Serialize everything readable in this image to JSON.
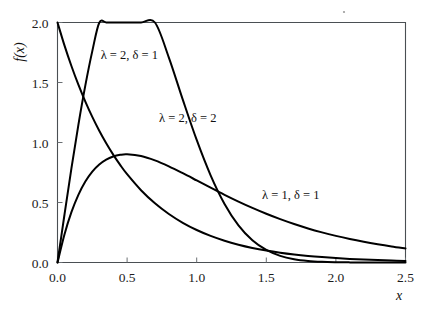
{
  "chart_data": {
    "type": "line",
    "title": "",
    "subtitle": "",
    "xlabel": "x",
    "ylabel": "f(x)",
    "xlim": [
      0.0,
      2.5
    ],
    "ylim": [
      0.0,
      2.0
    ],
    "xticks": [
      "0.0",
      "0.5",
      "1.0",
      "1.5",
      "2.0",
      "2.5"
    ],
    "xtick_values": [
      0.0,
      0.5,
      1.0,
      1.5,
      2.0,
      2.5
    ],
    "yticks": [
      "0.0",
      "0.5",
      "1.0",
      "1.5",
      "2.0"
    ],
    "ytick_values": [
      0.0,
      0.5,
      1.0,
      1.5,
      2.0
    ],
    "grid": false,
    "legend_position": "inline-annotations",
    "series": [
      {
        "name": "λ = 2, δ = 1",
        "lambda": 2,
        "delta": 1,
        "label_x": 0.31,
        "label_y": 1.7,
        "x": [
          0.0,
          0.05,
          0.1,
          0.15,
          0.2,
          0.25,
          0.3,
          0.35,
          0.4,
          0.45,
          0.5,
          0.6,
          0.7,
          0.8,
          0.9,
          1.0,
          1.1,
          1.2,
          1.3,
          1.4,
          1.5,
          1.6,
          1.7,
          1.8,
          1.9,
          2.0,
          2.1,
          2.2,
          2.3,
          2.4,
          2.5
        ],
        "values": [
          2.0,
          1.8097,
          1.6375,
          1.4816,
          1.3406,
          1.2131,
          1.0976,
          0.9932,
          0.8987,
          0.8131,
          0.7358,
          0.6024,
          0.4932,
          0.4038,
          0.3306,
          0.2707,
          0.2216,
          0.1815,
          0.1486,
          0.1216,
          0.0996,
          0.0815,
          0.0668,
          0.0547,
          0.0448,
          0.0366,
          0.03,
          0.0246,
          0.0201,
          0.0165,
          0.0135
        ]
      },
      {
        "name": "λ = 2, δ = 2",
        "lambda": 2,
        "delta": 2,
        "label_x": 0.73,
        "label_y": 1.17,
        "x": [
          0.0,
          0.05,
          0.1,
          0.15,
          0.2,
          0.25,
          0.3,
          0.35,
          0.4,
          0.45,
          0.5,
          0.6,
          0.7,
          0.8,
          0.9,
          1.0,
          1.1,
          1.2,
          1.3,
          1.4,
          1.5,
          1.6,
          1.7,
          1.8,
          1.9,
          2.0,
          2.1,
          2.2,
          2.3,
          2.4,
          2.5
        ],
        "values": [
          0.0,
          0.398,
          0.7842,
          1.1468,
          1.4756,
          1.7616,
          1.9983,
          2.181,
          2.3076,
          2.3785,
          2.3963,
          2.282,
          2.0334,
          1.7079,
          1.3574,
          1.0212,
          0.7264,
          0.488,
          0.3093,
          0.185,
          0.1044,
          0.0556,
          0.0279,
          0.0132,
          0.0059,
          0.0025,
          0.001,
          0.0004,
          0.0001,
          0.0,
          0.0
        ]
      },
      {
        "name": "λ = 1, δ = 1",
        "lambda": 1,
        "delta": 1,
        "label_x": 1.47,
        "label_y": 0.53,
        "x": [
          0.0,
          0.05,
          0.1,
          0.15,
          0.2,
          0.25,
          0.3,
          0.35,
          0.4,
          0.45,
          0.5,
          0.6,
          0.7,
          0.8,
          0.9,
          1.0,
          1.1,
          1.2,
          1.3,
          1.4,
          1.5,
          1.6,
          1.7,
          1.8,
          1.9,
          2.0,
          2.1,
          2.2,
          2.3,
          2.4,
          2.5
        ],
        "values": [
          0.0,
          0.2337,
          0.4192,
          0.564,
          0.6749,
          0.7576,
          0.8172,
          0.858,
          0.8836,
          0.8973,
          0.9016,
          0.8879,
          0.8512,
          0.8013,
          0.7441,
          0.6838,
          0.6231,
          0.564,
          0.5076,
          0.4547,
          0.4058,
          0.3611,
          0.3205,
          0.284,
          0.2512,
          0.2219,
          0.1957,
          0.1724,
          0.1517,
          0.1333,
          0.117
        ]
      }
    ],
    "note": "Three probability density curves; axes framed on all four sides with inward ticks."
  },
  "labels": {
    "y_axis_title": "f(x)",
    "x_axis_title": "x",
    "series_1": "λ = 2, δ = 1",
    "series_2": "λ = 2, δ = 2",
    "series_3": "λ = 1, δ = 1"
  },
  "colors": {
    "curve": "#000000",
    "axis": "#555a5e",
    "text": "#1a1a1a",
    "background": "#ffffff"
  }
}
